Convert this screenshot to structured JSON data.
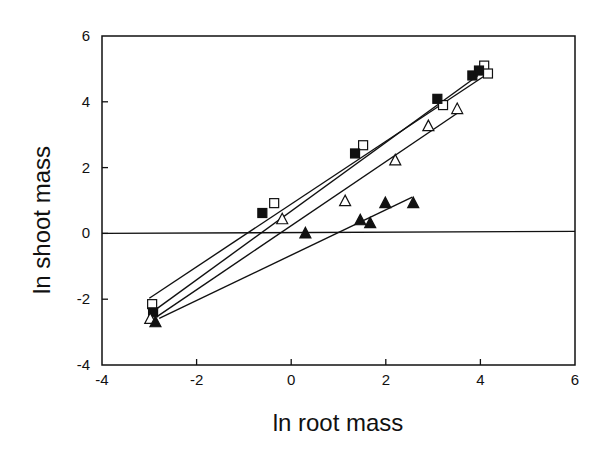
{
  "chart_data": {
    "type": "scatter",
    "title": "",
    "xlabel": "ln root mass",
    "ylabel": "ln shoot mass",
    "xlim": [
      -4,
      6
    ],
    "ylim": [
      -4,
      6
    ],
    "xticks": [
      -4,
      -2,
      0,
      2,
      4,
      6
    ],
    "yticks": [
      -4,
      -2,
      0,
      2,
      4,
      6
    ],
    "grid": false,
    "legend": null,
    "reference_line": {
      "y": 0,
      "description": "horizontal line at y = 0"
    },
    "series": [
      {
        "name": "open squares",
        "marker": "open-square",
        "points": [
          {
            "x": -2.94,
            "y": -2.15
          },
          {
            "x": -0.36,
            "y": 0.92
          },
          {
            "x": 1.52,
            "y": 2.68
          },
          {
            "x": 3.21,
            "y": 3.9
          },
          {
            "x": 4.08,
            "y": 5.1
          },
          {
            "x": 4.16,
            "y": 4.86
          }
        ],
        "fit_line": {
          "x1": -3.0,
          "y1": -1.97,
          "x2": 4.1,
          "y2": 4.8
        }
      },
      {
        "name": "filled squares",
        "marker": "filled-square",
        "points": [
          {
            "x": -2.92,
            "y": -2.4
          },
          {
            "x": -0.61,
            "y": 0.62
          },
          {
            "x": 1.35,
            "y": 2.43
          },
          {
            "x": 3.09,
            "y": 4.09
          },
          {
            "x": 3.83,
            "y": 4.8
          },
          {
            "x": 3.97,
            "y": 4.95
          }
        ],
        "fit_line": {
          "x1": -2.89,
          "y1": -2.34,
          "x2": 3.95,
          "y2": 4.8
        }
      },
      {
        "name": "open triangles",
        "marker": "open-triangle",
        "points": [
          {
            "x": -2.98,
            "y": -2.6
          },
          {
            "x": -0.19,
            "y": 0.43
          },
          {
            "x": 1.14,
            "y": 0.98
          },
          {
            "x": 2.2,
            "y": 2.22
          },
          {
            "x": 2.9,
            "y": 3.26
          },
          {
            "x": 3.51,
            "y": 3.78
          }
        ],
        "fit_line": {
          "x1": -2.83,
          "y1": -2.52,
          "x2": 3.55,
          "y2": 3.69
        }
      },
      {
        "name": "filled triangles",
        "marker": "filled-triangle",
        "points": [
          {
            "x": -2.87,
            "y": -2.7
          },
          {
            "x": 0.3,
            "y": 0.0
          },
          {
            "x": 1.46,
            "y": 0.4
          },
          {
            "x": 1.67,
            "y": 0.31
          },
          {
            "x": 1.99,
            "y": 0.92
          },
          {
            "x": 2.58,
            "y": 0.92
          }
        ],
        "fit_line": {
          "x1": -2.79,
          "y1": -2.58,
          "x2": 2.56,
          "y2": 1.1
        }
      }
    ]
  }
}
